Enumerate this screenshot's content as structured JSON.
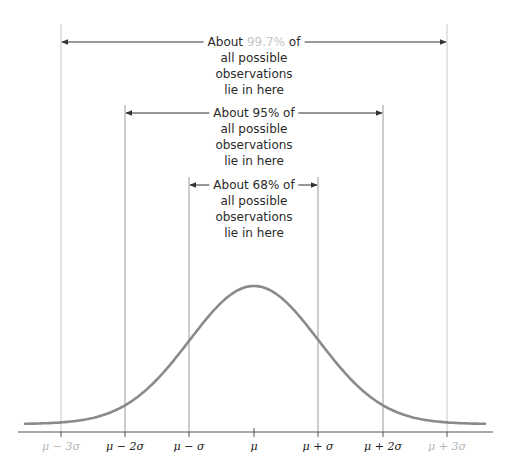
{
  "chart_data": {
    "type": "line",
    "title": "",
    "xlabel": "",
    "ylabel": "",
    "x_ticks": [
      "μ − 3σ",
      "μ − 2σ",
      "μ − σ",
      "μ",
      "μ + σ",
      "μ + 2σ",
      "μ + 3σ"
    ],
    "x_tick_sigma": [
      -3,
      -2,
      -1,
      0,
      1,
      2,
      3
    ],
    "grid": false,
    "annotations": [
      {
        "range_sigma": [
          -3,
          3
        ],
        "text_lines": [
          "About 99.7% of",
          "all possible",
          "observations",
          "lie in here"
        ],
        "percent": "99.7%"
      },
      {
        "range_sigma": [
          -2,
          2
        ],
        "text_lines": [
          "About 95% of",
          "all possible",
          "observations",
          "lie in here"
        ],
        "percent": "95%"
      },
      {
        "range_sigma": [
          -1,
          1
        ],
        "text_lines": [
          "About 68% of",
          "all possible",
          "observations",
          "lie in here"
        ],
        "percent": "68%"
      }
    ]
  },
  "labels": {
    "band3": {
      "prefix": "About ",
      "pct": "99.7%",
      "suffix": " of",
      "line2": "all possible",
      "line3": "observations",
      "line4": "lie in here"
    },
    "band2": {
      "line1": "About 95% of",
      "line2": "all possible",
      "line3": "observations",
      "line4": "lie in here"
    },
    "band1": {
      "line1": "About 68% of",
      "line2": "all possible",
      "line3": "observations",
      "line4": "lie in here"
    }
  },
  "ticks": {
    "m3": "μ − 3σ",
    "m2": "μ − 2σ",
    "m1": "μ − σ",
    "mu": "μ",
    "p1": "μ + σ",
    "p2": "μ + 2σ",
    "p3": "μ + 3σ"
  },
  "colors": {
    "curve": "#8a8a8a",
    "axis": "#555555",
    "faint_text": "#bdbdbd",
    "text": "#2a2a2a"
  }
}
